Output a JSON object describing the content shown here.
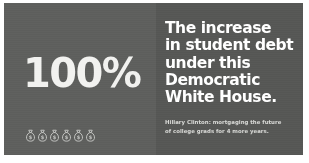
{
  "card": {
    "background_color": "#ffffff",
    "left_panel_color": "#5f605e",
    "right_panel_color": "#575856"
  },
  "left_panel": {
    "stat_number": "100%",
    "stat_color": "#f2f2f0",
    "icon_name": "money-bag-icon",
    "icon_count": 6,
    "icon_color": "#d8d9d6"
  },
  "right_panel": {
    "headline_color": "#ffffff",
    "headline_lines": [
      "The increase",
      "in student debt",
      "under this",
      "Democratic",
      "White House."
    ],
    "headline_full": "The increase in student debt under this Democratic White House.",
    "caption_color": "#e2e3e0",
    "caption_lines": [
      "Hillary Clinton: mortgaging the future",
      "of college grads for 4 more years."
    ],
    "caption_full": "Hillary Clinton: mortgaging the future of college grads for 4 more years."
  }
}
